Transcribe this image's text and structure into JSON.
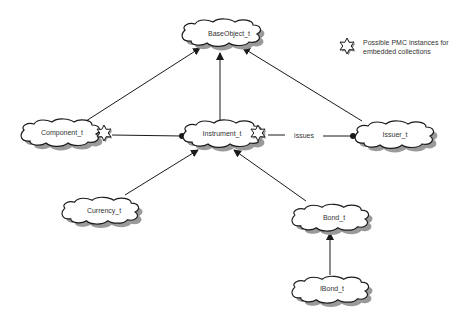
{
  "diagram": {
    "type": "class-relationship-diagram",
    "nodes": [
      {
        "id": "baseobject",
        "label": "BaseObject_t",
        "cx": 229,
        "cy": 33
      },
      {
        "id": "component",
        "label": "Component_t",
        "cx": 58,
        "cy": 131
      },
      {
        "id": "instrument",
        "label": "Instrument_t",
        "cx": 223,
        "cy": 133
      },
      {
        "id": "issuer",
        "label": "Issuer_t",
        "cx": 395,
        "cy": 134
      },
      {
        "id": "currency",
        "label": "Currency_t",
        "cx": 102,
        "cy": 209
      },
      {
        "id": "bond",
        "label": "Bond_t",
        "cx": 330,
        "cy": 217
      },
      {
        "id": "ibond",
        "label": "IBond_t",
        "cx": 330,
        "cy": 288
      }
    ],
    "edges": [
      {
        "from": "component",
        "to": "baseobject",
        "style": "arrow"
      },
      {
        "from": "instrument",
        "to": "baseobject",
        "style": "arrow"
      },
      {
        "from": "issuer",
        "to": "baseobject",
        "style": "arrow"
      },
      {
        "from": "component",
        "to": "instrument",
        "style": "dot-end"
      },
      {
        "from": "instrument",
        "to": "issuer",
        "style": "dot-end",
        "label": "issues"
      },
      {
        "from": "currency",
        "to": "instrument",
        "style": "arrow"
      },
      {
        "from": "bond",
        "to": "instrument",
        "style": "arrow"
      },
      {
        "from": "ibond",
        "to": "bond",
        "style": "arrow"
      }
    ],
    "edge_label_issues": "issues",
    "stars_on": [
      "component",
      "instrument"
    ]
  },
  "legend": {
    "icon": "star-burst-icon",
    "line1": "Possible PMC instances for",
    "line2": "embedded collections"
  },
  "labels": {
    "baseobject": "BaseObject_t",
    "component": "Component_t",
    "instrument": "Instrument_t",
    "issuer": "Issuer_t",
    "currency": "Currency_t",
    "bond": "Bond_t",
    "ibond": "IBond_t"
  },
  "colors": {
    "line": "#1a1a1a",
    "cloud_fill": "#ffffff",
    "cloud_stroke": "#1a1a1a",
    "shadow": "#9a9a9a",
    "text": "#333333"
  }
}
